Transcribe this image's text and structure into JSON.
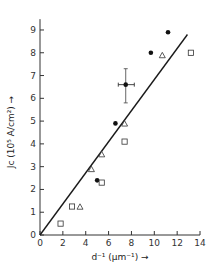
{
  "chart_data": {
    "type": "scatter",
    "title": "",
    "xlabel": "d⁻¹ (μm⁻¹) →",
    "ylabel": "J_c (10⁵ A/cm²) →",
    "xlim": [
      0,
      14
    ],
    "ylim": [
      0,
      9.3
    ],
    "x_ticks": [
      0,
      2,
      4,
      6,
      8,
      10,
      12,
      14
    ],
    "y_ticks": [
      0,
      1,
      2,
      3,
      4,
      5,
      6,
      7,
      8,
      9
    ],
    "grid": false,
    "legend": null,
    "series": [
      {
        "name": "filled-circles",
        "marker": "circle-filled",
        "points": [
          {
            "x": 5.0,
            "y": 2.4
          },
          {
            "x": 6.6,
            "y": 4.9
          },
          {
            "x": 7.5,
            "y": 6.6,
            "xerr": [
              6.85,
              8.25
            ],
            "yerr": [
              5.8,
              7.3
            ]
          },
          {
            "x": 9.7,
            "y": 8.0
          },
          {
            "x": 11.2,
            "y": 8.9
          }
        ]
      },
      {
        "name": "open-triangles",
        "marker": "triangle-open",
        "points": [
          {
            "x": 3.5,
            "y": 1.25
          },
          {
            "x": 4.5,
            "y": 2.9
          },
          {
            "x": 5.4,
            "y": 3.55
          },
          {
            "x": 7.4,
            "y": 4.9
          },
          {
            "x": 10.7,
            "y": 7.9
          }
        ]
      },
      {
        "name": "open-squares",
        "marker": "square-open",
        "points": [
          {
            "x": 1.8,
            "y": 0.5
          },
          {
            "x": 2.8,
            "y": 1.25
          },
          {
            "x": 5.4,
            "y": 2.3
          },
          {
            "x": 7.4,
            "y": 4.1
          },
          {
            "x": 13.2,
            "y": 8.0
          }
        ]
      }
    ],
    "fit_line": {
      "x0": 0,
      "y0": 0,
      "x1": 12.9,
      "y1": 8.8
    }
  },
  "labels": {
    "x_axis": "d⁻¹ (μm⁻¹) →",
    "y_axis": "Jᴄ (10⁵ A/cm²) →"
  }
}
